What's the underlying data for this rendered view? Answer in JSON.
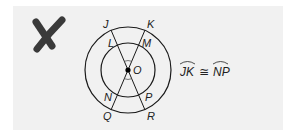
{
  "figure": {
    "mark": "incorrect-x-mark",
    "mark_color": "#3a3a3a",
    "panel_color": "#f1f1f1",
    "center_label": "O",
    "points": {
      "J": "J",
      "K": "K",
      "L": "L",
      "M": "M",
      "N": "N",
      "P": "P",
      "Q": "Q",
      "R": "R"
    },
    "statement": {
      "left_arc": "JK",
      "relation": "≅",
      "right_arc": "NP"
    },
    "circles": [
      {
        "name": "outer",
        "cx": 128,
        "cy": 70,
        "r": 43
      },
      {
        "name": "inner",
        "cx": 128,
        "cy": 70,
        "r": 27
      }
    ],
    "chords": [
      {
        "from": "J",
        "to": "R"
      },
      {
        "from": "K",
        "to": "Q"
      }
    ]
  }
}
